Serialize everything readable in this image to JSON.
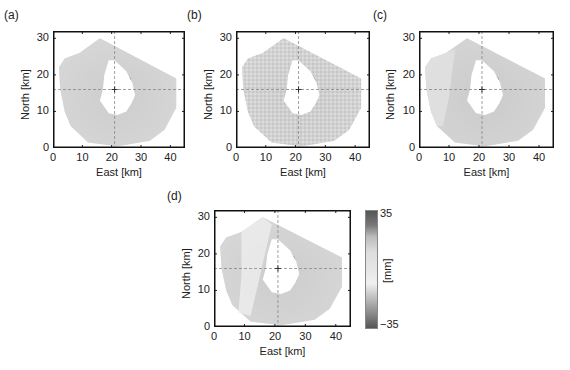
{
  "chart_data": [
    {
      "type": "heatmap",
      "panel": "(a)",
      "xlabel": "East [km]",
      "ylabel": "North [km]",
      "xticks": [
        0,
        10,
        20,
        30,
        40
      ],
      "yticks": [
        0,
        10,
        20,
        30
      ],
      "xlim": [
        0,
        45
      ],
      "ylim": [
        0,
        32
      ],
      "crosshair": {
        "x": 21,
        "y": 16
      }
    },
    {
      "type": "heatmap",
      "panel": "(b)",
      "xlabel": "East [km]",
      "ylabel": "North [km]",
      "xticks": [
        0,
        10,
        20,
        30,
        40
      ],
      "yticks": [
        0,
        10,
        20,
        30
      ],
      "xlim": [
        0,
        45
      ],
      "ylim": [
        0,
        32
      ],
      "crosshair": {
        "x": 21,
        "y": 16
      }
    },
    {
      "type": "heatmap",
      "panel": "(c)",
      "xlabel": "East [km]",
      "ylabel": "North [km]",
      "xticks": [
        0,
        10,
        20,
        30,
        40
      ],
      "yticks": [
        0,
        10,
        20,
        30
      ],
      "xlim": [
        0,
        45
      ],
      "ylim": [
        0,
        32
      ],
      "crosshair": {
        "x": 21,
        "y": 16
      }
    },
    {
      "type": "heatmap",
      "panel": "(d)",
      "xlabel": "East [km]",
      "ylabel": "North [km]",
      "xticks": [
        0,
        10,
        20,
        30,
        40
      ],
      "yticks": [
        0,
        10,
        20,
        30
      ],
      "xlim": [
        0,
        45
      ],
      "ylim": [
        0,
        32
      ],
      "crosshair": {
        "x": 21,
        "y": 16
      },
      "colorbar": {
        "label": "[mm]",
        "min": -35,
        "max": 35,
        "min_label": "−35",
        "max_label": "35"
      }
    }
  ],
  "panels": {
    "a": {
      "label": "(a)",
      "xlabel": "East [km]",
      "ylabel": "North [km]"
    },
    "b": {
      "label": "(b)",
      "xlabel": "East [km]",
      "ylabel": "North [km]"
    },
    "c": {
      "label": "(c)",
      "xlabel": "East [km]",
      "ylabel": "North [km]"
    },
    "d": {
      "label": "(d)",
      "xlabel": "East [km]",
      "ylabel": "North [km]"
    }
  },
  "ticks": {
    "x": [
      "0",
      "10",
      "20",
      "30",
      "40"
    ],
    "y": [
      "0",
      "10",
      "20",
      "30"
    ]
  },
  "colorbar": {
    "label": "[mm]",
    "max_label": "35",
    "min_label": "−35"
  }
}
